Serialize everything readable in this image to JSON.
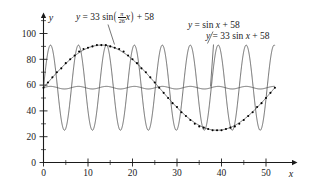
{
  "figure": {
    "background": "#ffffff",
    "curve_color": "#3f3f3f",
    "axis_color": "#1a1a1a",
    "point_color": "#000000"
  },
  "axes": {
    "x_axis_name": "x",
    "y_axis_name": "y",
    "x_ticks": [
      "0",
      "10",
      "20",
      "30",
      "40",
      "50"
    ],
    "y_ticks": [
      "0",
      "20",
      "40",
      "60",
      "80",
      "100"
    ],
    "x_minor_step": 5,
    "y_minor_step": 10
  },
  "labels": {
    "slow": {
      "lhs": "y",
      "eq": "=",
      "coef": "33",
      "fn": "sin",
      "num": "π",
      "den": "26",
      "var": "x",
      "plus": "+",
      "const": "58"
    },
    "small": {
      "text": "y = sin x + 58",
      "lhs": "y",
      "eq": "=",
      "fn": "sin",
      "var": "x",
      "plus": "+",
      "const": "58"
    },
    "tall": {
      "text": "y = 33 sin x + 58",
      "lhs": "y",
      "eq": "=",
      "coef": "33",
      "fn": "sin",
      "var": "x",
      "plus": "+",
      "const": "58"
    }
  },
  "chart_data": {
    "type": "line",
    "title": "",
    "xlabel": "x",
    "ylabel": "y",
    "xlim": [
      -1,
      54
    ],
    "ylim": [
      0,
      105
    ],
    "grid": false,
    "legend": "annotations",
    "x_ticks": [
      0,
      10,
      20,
      30,
      40,
      50
    ],
    "y_ticks": [
      0,
      20,
      40,
      60,
      80,
      100
    ],
    "series": [
      {
        "name": "y = 33 sin((pi/26) x) + 58",
        "type": "line",
        "amplitude": 33,
        "period": 52,
        "offset": 58,
        "formula": "33*sin(pi/26*x)+58",
        "x_range": [
          0,
          52
        ],
        "has_data_points": true,
        "data_points_x": [
          0,
          1,
          2,
          3,
          4,
          5,
          6,
          7,
          8,
          9,
          10,
          11,
          12,
          13,
          14,
          15,
          16,
          17,
          18,
          19,
          20,
          21,
          22,
          23,
          24,
          25,
          26,
          27,
          28,
          29,
          30,
          31,
          32,
          33,
          34,
          35,
          36,
          37,
          38,
          39,
          40,
          41,
          42,
          43,
          44,
          45,
          46,
          47,
          48,
          49,
          50,
          51,
          52
        ],
        "data_points_y": [
          58,
          62,
          66,
          70,
          73,
          77,
          80,
          83,
          86,
          88,
          89,
          90,
          91,
          91,
          91,
          90,
          89,
          88,
          86,
          83,
          80,
          77,
          73,
          70,
          66,
          62,
          58,
          54,
          50,
          46,
          43,
          39,
          36,
          33,
          30,
          28,
          27,
          26,
          25,
          25,
          25,
          26,
          27,
          28,
          30,
          33,
          36,
          39,
          43,
          46,
          50,
          54,
          58
        ]
      },
      {
        "name": "y = 33 sin x + 58",
        "type": "line",
        "amplitude": 33,
        "period": 6.283,
        "offset": 58,
        "formula": "33*sin(x)+58",
        "x_range": [
          0,
          52
        ]
      },
      {
        "name": "y = sin x + 58",
        "type": "line",
        "amplitude": 1,
        "period": 6.283,
        "offset": 58,
        "formula": "sin(x)+58",
        "x_range": [
          0,
          52
        ]
      }
    ]
  }
}
